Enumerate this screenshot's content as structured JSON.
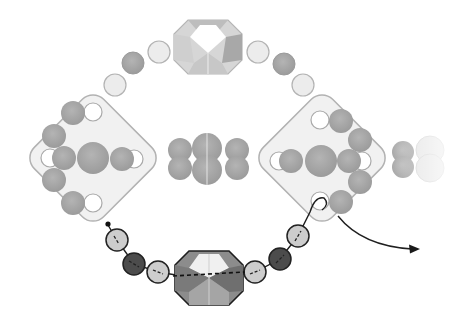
{
  "diagram": {
    "colors": {
      "background": "#ffffff",
      "tile_fill": "#f2f2f2",
      "tile_stroke": "#b5b5b5",
      "bead_medium": "#a8a8a8",
      "bead_light": "#e6e6e6",
      "bead_white": "#ffffff",
      "bead_dark": "#4a4a4a",
      "bead_pale": "#cfcfcf",
      "thread": "#222222",
      "crystal_light": "#d8d8d8",
      "crystal_dark": "#8a8a8a"
    },
    "tiles": [
      {
        "name": "left-two-hole-tile",
        "cx": 93,
        "cy": 158,
        "size": 98
      },
      {
        "name": "right-two-hole-tile",
        "cx": 322,
        "cy": 158,
        "size": 98
      }
    ],
    "top_arc_beads": [
      {
        "cx": 115,
        "cy": 85,
        "r": 11,
        "tone": "light"
      },
      {
        "cx": 133,
        "cy": 64,
        "r": 11,
        "tone": "medium"
      },
      {
        "cx": 159,
        "cy": 52,
        "r": 11,
        "tone": "light"
      },
      {
        "cx": 258,
        "cy": 52,
        "r": 11,
        "tone": "light"
      },
      {
        "cx": 284,
        "cy": 64,
        "r": 11,
        "tone": "medium"
      },
      {
        "cx": 303,
        "cy": 85,
        "r": 11,
        "tone": "light"
      }
    ],
    "top_crystal": {
      "cx": 208,
      "cy": 47,
      "w": 68,
      "h": 56,
      "style": "faded"
    },
    "bottom_crystal": {
      "cx": 209,
      "cy": 278,
      "w": 68,
      "h": 56,
      "style": "bold"
    },
    "bottom_path_beads": [
      {
        "cx": 117,
        "cy": 240,
        "r": 11,
        "tone": "pale"
      },
      {
        "cx": 134,
        "cy": 264,
        "r": 11,
        "tone": "dark"
      },
      {
        "cx": 158,
        "cy": 272,
        "r": 11,
        "tone": "pale"
      },
      {
        "cx": 255,
        "cy": 272,
        "r": 11,
        "tone": "pale"
      },
      {
        "cx": 280,
        "cy": 259,
        "r": 11,
        "tone": "dark"
      },
      {
        "cx": 298,
        "cy": 236,
        "r": 11,
        "tone": "pale"
      }
    ],
    "center_row_beads": [
      {
        "cx": 182,
        "cy": 150,
        "r": 12,
        "tone": "medium"
      },
      {
        "cx": 182,
        "cy": 168,
        "r": 12,
        "tone": "medium"
      },
      {
        "cx": 208,
        "cy": 148,
        "r": 15,
        "tone": "medium"
      },
      {
        "cx": 208,
        "cy": 170,
        "r": 15,
        "tone": "medium"
      },
      {
        "cx": 236,
        "cy": 150,
        "r": 12,
        "tone": "medium"
      },
      {
        "cx": 236,
        "cy": 168,
        "r": 12,
        "tone": "medium"
      }
    ],
    "right_fade_beads": [
      {
        "cx": 403,
        "cy": 152,
        "r": 11,
        "tone": "medium"
      },
      {
        "cx": 403,
        "cy": 166,
        "r": 11,
        "tone": "medium"
      },
      {
        "cx": 429,
        "cy": 150,
        "r": 14,
        "tone": "faded"
      },
      {
        "cx": 429,
        "cy": 168,
        "r": 14,
        "tone": "faded"
      }
    ],
    "arrow": {
      "direction": "exit-right",
      "label": ""
    }
  }
}
